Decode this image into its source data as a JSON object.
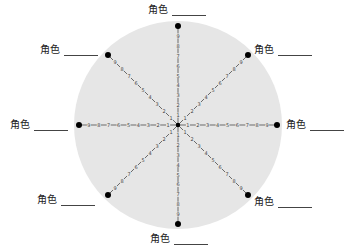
{
  "diagram": {
    "center": [
      178,
      125
    ],
    "circle_radius": 104,
    "spoke_radius": 99,
    "circle_color": "#e6e6e6",
    "spoke_color": "#333333",
    "tick_labels": [
      "1",
      "2",
      "3",
      "4",
      "5",
      "6",
      "7",
      "8",
      "9"
    ],
    "roles": [
      {
        "label": "角色",
        "position": "top",
        "x": 148,
        "y": 4
      },
      {
        "label": "角色",
        "position": "top-right",
        "x": 254,
        "y": 44
      },
      {
        "label": "角色",
        "position": "right",
        "x": 286,
        "y": 119
      },
      {
        "label": "角色",
        "position": "bottom-right",
        "x": 254,
        "y": 196
      },
      {
        "label": "角色",
        "position": "bottom",
        "x": 150,
        "y": 233
      },
      {
        "label": "角色",
        "position": "bottom-left",
        "x": 37,
        "y": 194
      },
      {
        "label": "角色",
        "position": "left",
        "x": 10,
        "y": 119
      },
      {
        "label": "角色",
        "position": "top-left",
        "x": 40,
        "y": 44
      }
    ]
  }
}
